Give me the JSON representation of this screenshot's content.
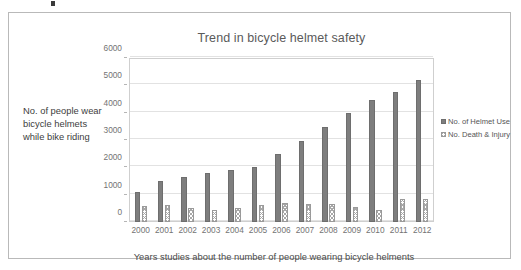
{
  "chart_data": {
    "type": "bar",
    "title": "Trend in bicycle helmet safety",
    "xlabel": "Years studies about the number of people wearing bicycle helments",
    "ylabel": "No. of people wear bicycle helmets while bike riding",
    "categories": [
      "2000",
      "2001",
      "2002",
      "2003",
      "2004",
      "2005",
      "2006",
      "2007",
      "2008",
      "2009",
      "2010",
      "2011",
      "2012"
    ],
    "series": [
      {
        "name": "No. of Helmet Use",
        "values": [
          1100,
          1500,
          1650,
          1790,
          1890,
          2000,
          2480,
          2980,
          3460,
          3990,
          4480,
          4750,
          5200
        ]
      },
      {
        "name": "No. Death & Injury",
        "values": [
          600,
          610,
          500,
          440,
          500,
          610,
          700,
          660,
          660,
          560,
          430,
          840,
          840
        ]
      }
    ],
    "ylim": [
      0,
      6000
    ],
    "ytick_values": [
      0,
      1000,
      2000,
      3000,
      4000,
      5000,
      6000
    ],
    "ytick_labels": [
      "0",
      "1000",
      "2000",
      "3000",
      "4000",
      "5000",
      "6000"
    ],
    "grid": true,
    "legend_position": "right",
    "colors": {
      "series_1_fill": "#7e7e7e",
      "series_1_border": "#6e6e6e",
      "series_2_fill": "#ffffff",
      "series_2_border": "#9a9a9a",
      "series_2_hatch": "#a8a8a8",
      "gridline": "#e2e2e2",
      "plot_border": "#cfcfcf",
      "frame_border": "#b9b9b9",
      "text": "#555555"
    }
  },
  "legend": {
    "items": [
      {
        "label": "No. of Helmet Use",
        "swatch": "solid-square-marker"
      },
      {
        "label": "No. Death & Injury",
        "swatch": "hatched-square-marker"
      }
    ]
  }
}
